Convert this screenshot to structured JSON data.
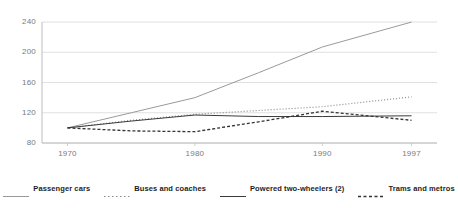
{
  "chart_data": {
    "type": "line",
    "title": "",
    "subtitle": "",
    "xlabel": "",
    "ylabel": "",
    "x": [
      1970,
      1975,
      1980,
      1985,
      1990,
      1997
    ],
    "xlim": [
      1968,
      1999
    ],
    "ylim": [
      80,
      248
    ],
    "xticks": [
      "1970",
      "1980",
      "1990",
      "1997"
    ],
    "xtick_values": [
      1970,
      1980,
      1990,
      1997
    ],
    "yticks": [
      "80",
      "120",
      "160",
      "200",
      "240"
    ],
    "ytick_values": [
      80,
      120,
      160,
      200,
      240
    ],
    "grid": "horizontal",
    "legend_position": "bottom",
    "series": [
      {
        "name": "Passenger cars",
        "style": "solid",
        "color": "#9a9a9a",
        "width": 1,
        "values": [
          100,
          120,
          140,
          173,
          207,
          240
        ]
      },
      {
        "name": "Buses and coaches",
        "style": "dotted",
        "color": "#8c8c8c",
        "width": 1.2,
        "values": [
          100,
          110,
          118,
          123,
          128,
          141
        ]
      },
      {
        "name": "Powered two-wheelers (2)",
        "style": "solid",
        "color": "#3a3a3a",
        "width": 1,
        "values": [
          100,
          109,
          117,
          115,
          115,
          116
        ]
      },
      {
        "name": "Trams and metros",
        "style": "dashed",
        "color": "#333333",
        "width": 1.3,
        "values": [
          100,
          96,
          95,
          108,
          122,
          110
        ]
      }
    ]
  },
  "legend": {
    "items": [
      {
        "label": "Passenger cars",
        "key": "passenger-cars"
      },
      {
        "label": "Buses and coaches",
        "key": "buses-and-coaches"
      },
      {
        "label": "Powered two-wheelers (2)",
        "key": "powered-two-wheelers"
      },
      {
        "label": "Trams and metros",
        "key": "trams-and-metros"
      }
    ]
  }
}
